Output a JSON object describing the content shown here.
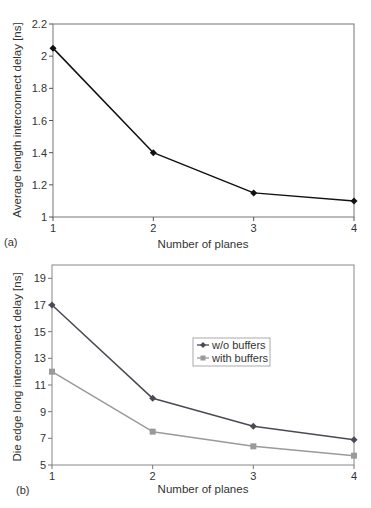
{
  "chart_data": [
    {
      "type": "line",
      "panel_label": "(a)",
      "title": "",
      "xlabel": "Number of planes",
      "ylabel": "Average length interconnect delay [ns]",
      "x": [
        1,
        2,
        3,
        4
      ],
      "xticks": [
        "1",
        "2",
        "3",
        "4"
      ],
      "yticks": [
        "1",
        "1.2",
        "1.4",
        "1.6",
        "1.8",
        "2",
        "2.2"
      ],
      "ylim": [
        1,
        2.2
      ],
      "xlim": [
        1,
        4
      ],
      "grid": false,
      "legend": null,
      "series": [
        {
          "name": "Average length interconnect delay",
          "values": [
            2.05,
            1.4,
            1.15,
            1.1
          ],
          "color": "#111111",
          "marker": "diamond"
        }
      ]
    },
    {
      "type": "line",
      "panel_label": "(b)",
      "title": "",
      "xlabel": "Number of planes",
      "ylabel": "Die edge long interconnect delay [ns]",
      "x": [
        1,
        2,
        3,
        4
      ],
      "xticks": [
        "1",
        "2",
        "3",
        "4"
      ],
      "yticks": [
        "5",
        "7",
        "9",
        "11",
        "13",
        "15",
        "17",
        "19"
      ],
      "ylim": [
        5,
        20
      ],
      "xlim": [
        1,
        4
      ],
      "grid": false,
      "legend": {
        "position": "inside-center-right",
        "entries": [
          "w/o buffers",
          "with buffers"
        ]
      },
      "series": [
        {
          "name": "w/o buffers",
          "values": [
            17.0,
            10.0,
            7.9,
            6.9
          ],
          "color": "#4a4a55",
          "marker": "diamond"
        },
        {
          "name": "with buffers",
          "values": [
            12.0,
            7.5,
            6.4,
            5.7
          ],
          "color": "#9a9a9a",
          "marker": "square"
        }
      ]
    }
  ]
}
